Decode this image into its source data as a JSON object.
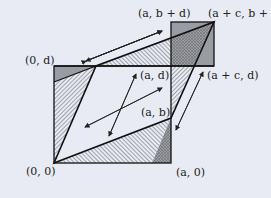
{
  "diagram": {
    "background": "#e8ebf3",
    "labels": {
      "origin": "(0, 0)",
      "a0": "(a, 0)",
      "ab": "(a, b)",
      "zero_d": "(0, d)",
      "ad": "(a, d)",
      "a_bd": "(a, b + d)",
      "ac_bd": "(a + c, b + d)",
      "ac_d": "(a + c, d)"
    }
  }
}
